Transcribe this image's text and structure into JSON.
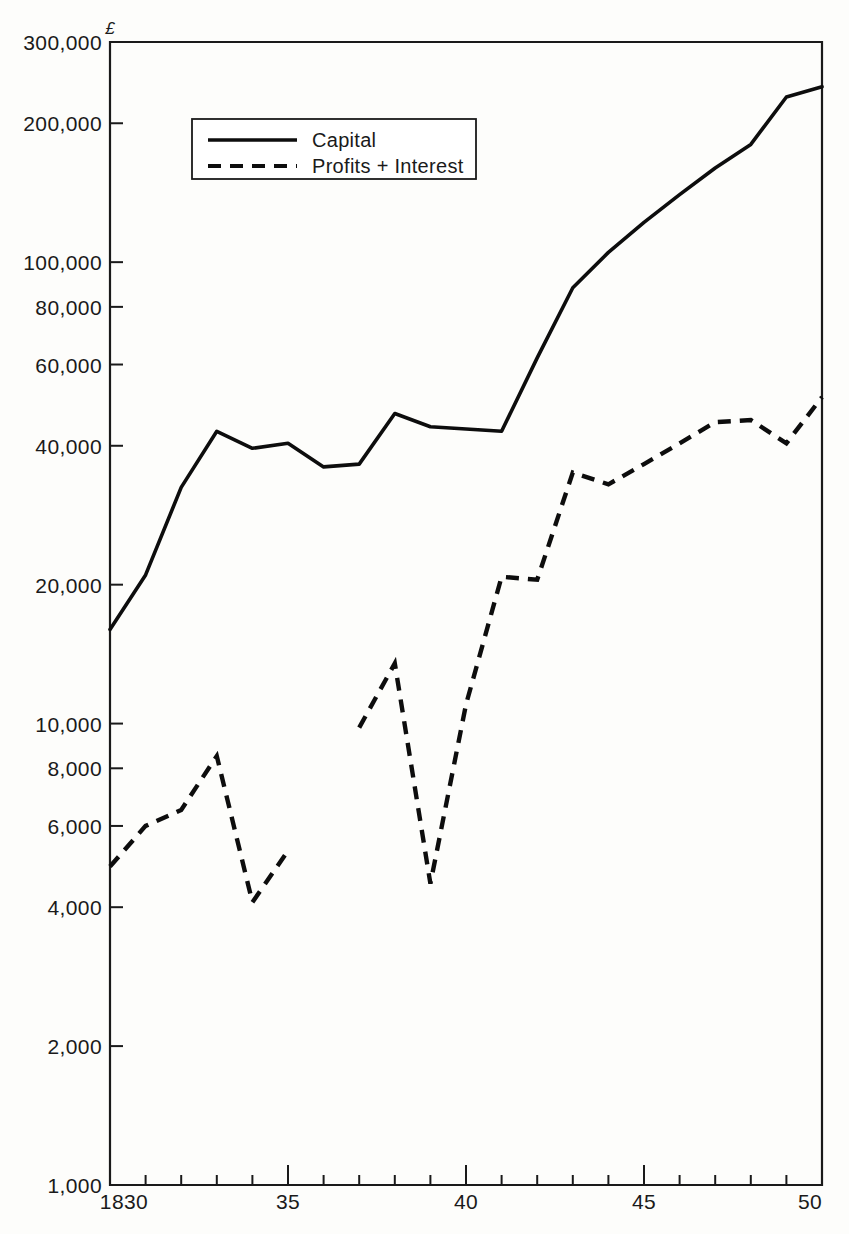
{
  "chart_data": {
    "type": "line",
    "title": "",
    "xlabel": "",
    "ylabel": "",
    "currency_symbol": "£",
    "scale": "log",
    "grid": false,
    "legend_position": "top-left-inside",
    "xlim": [
      1830,
      1850
    ],
    "ylim": [
      1000,
      300000
    ],
    "x_tick_labels": [
      "1830",
      "35",
      "40",
      "45",
      "50"
    ],
    "x_major_ticks": [
      1830,
      1835,
      1840,
      1845,
      1850
    ],
    "x_minor_ticks": [
      1831,
      1832,
      1833,
      1834,
      1836,
      1837,
      1838,
      1839,
      1841,
      1842,
      1843,
      1844,
      1846,
      1847,
      1848,
      1849
    ],
    "y_tick_values": [
      1000,
      2000,
      4000,
      6000,
      8000,
      10000,
      20000,
      40000,
      60000,
      80000,
      100000,
      200000,
      300000
    ],
    "y_tick_labels": [
      "1,000",
      "2,000",
      "4,000",
      "6,000",
      "8,000",
      "10,000",
      "20,000",
      "40,000",
      "60,000",
      "80,000",
      "100,000",
      "200,000",
      "300,000"
    ],
    "series": [
      {
        "name": "Capital",
        "style": "solid",
        "x": [
          1830,
          1831,
          1832,
          1833,
          1834,
          1835,
          1836,
          1837,
          1838,
          1839,
          1840,
          1841,
          1842,
          1843,
          1844,
          1845,
          1846,
          1847,
          1848,
          1849,
          1850
        ],
        "values": [
          16000,
          21000,
          32500,
          43000,
          39500,
          40500,
          36000,
          36500,
          47000,
          44000,
          43500,
          43000,
          62000,
          88000,
          105000,
          122000,
          140000,
          160000,
          180000,
          228000,
          240000
        ]
      },
      {
        "name": "Profits + Interest",
        "style": "dashed",
        "x": [
          1830,
          1831,
          1832,
          1833,
          1834,
          1835,
          1837,
          1838,
          1839,
          1840,
          1841,
          1842,
          1843,
          1844,
          1845,
          1846,
          1847,
          1848,
          1849,
          1850
        ],
        "values": [
          4900,
          6000,
          6500,
          8500,
          4100,
          5300,
          9800,
          13500,
          4500,
          11000,
          20800,
          20500,
          35000,
          33000,
          36500,
          40500,
          45000,
          45500,
          40500,
          51000
        ],
        "break_after": 1835
      }
    ],
    "legend": [
      {
        "label": "Capital",
        "style": "solid"
      },
      {
        "label": "Profits + Interest",
        "style": "dashed"
      }
    ]
  }
}
